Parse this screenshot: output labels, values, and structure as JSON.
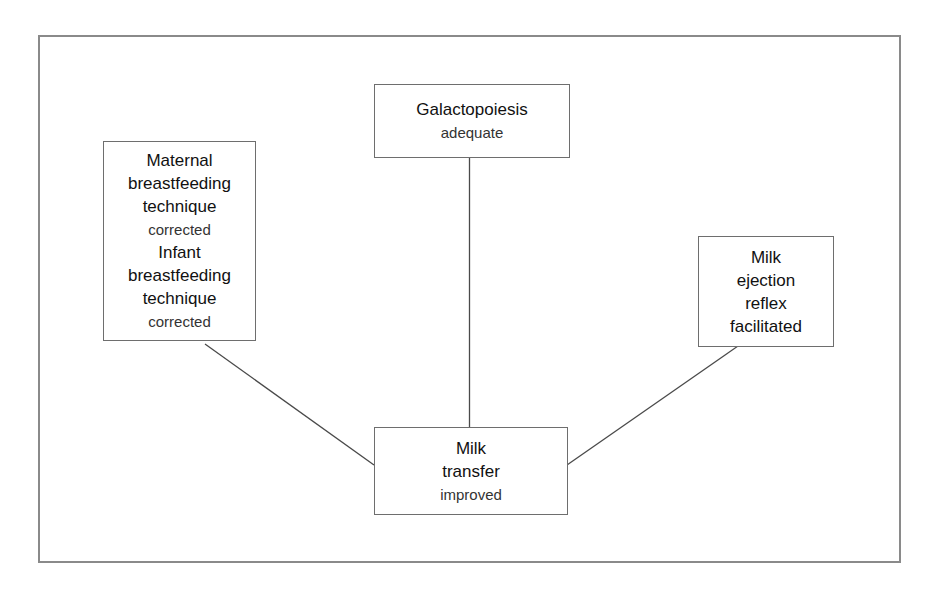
{
  "diagram": {
    "type": "hub-and-spoke",
    "nodes": {
      "galactopoiesis": {
        "lines": [
          {
            "text": "Galactopoiesis",
            "role": "title"
          },
          {
            "text": "adequate",
            "role": "status"
          }
        ]
      },
      "technique": {
        "lines": [
          {
            "text": "Maternal",
            "role": "title"
          },
          {
            "text": "breastfeeding",
            "role": "title"
          },
          {
            "text": "technique",
            "role": "title"
          },
          {
            "text": "corrected",
            "role": "status"
          },
          {
            "text": "Infant",
            "role": "title"
          },
          {
            "text": "breastfeeding",
            "role": "title"
          },
          {
            "text": "technique",
            "role": "title"
          },
          {
            "text": "corrected",
            "role": "status"
          }
        ]
      },
      "ejection": {
        "lines": [
          {
            "text": "Milk",
            "role": "title"
          },
          {
            "text": "ejection",
            "role": "title"
          },
          {
            "text": "reflex",
            "role": "title"
          },
          {
            "text": "facilitated",
            "role": "title"
          }
        ]
      },
      "transfer": {
        "lines": [
          {
            "text": "Milk",
            "role": "title"
          },
          {
            "text": "transfer",
            "role": "title"
          },
          {
            "text": "improved",
            "role": "status"
          }
        ]
      }
    },
    "edges": [
      {
        "from": "galactopoiesis",
        "to": "transfer"
      },
      {
        "from": "technique",
        "to": "transfer"
      },
      {
        "from": "ejection",
        "to": "transfer"
      }
    ],
    "colors": {
      "frame": "#8a8a8a",
      "box_border": "#6e6e6e",
      "connector": "#4a4a4a",
      "text": "#111111",
      "background": "#ffffff"
    }
  }
}
